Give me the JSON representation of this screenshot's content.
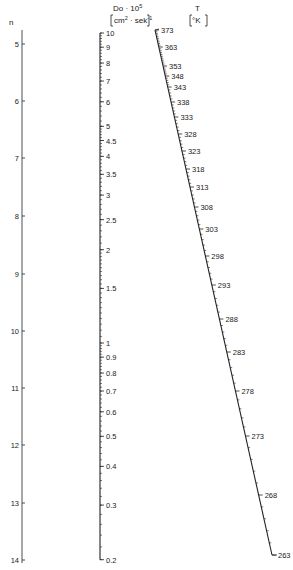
{
  "diagram": {
    "type": "nomogram",
    "colors": {
      "ink": "#222222",
      "background": "#ffffff"
    },
    "axes": {
      "n": {
        "title": "n",
        "scale": "linear",
        "x": 22,
        "ticks": [
          {
            "label": "5",
            "y": 44
          },
          {
            "label": "6",
            "y": 101
          },
          {
            "label": "7",
            "y": 158
          },
          {
            "label": "8",
            "y": 216
          },
          {
            "label": "9",
            "y": 274
          },
          {
            "label": "10",
            "y": 331
          },
          {
            "label": "11",
            "y": 388
          },
          {
            "label": "12",
            "y": 445
          },
          {
            "label": "13",
            "y": 503
          },
          {
            "label": "14",
            "y": 560
          }
        ]
      },
      "D": {
        "title_line1": "Do · 10",
        "title_line1_sup": "5",
        "title_line2": "cm",
        "title_line2_sup1": "2",
        "title_line2_mid": " · sek",
        "title_line2_sup2": "-1",
        "scale": "log",
        "x": 100,
        "y_at_1": 343,
        "px_per_decade": 310,
        "labels": [
          "10",
          "9",
          "8",
          "7",
          "6",
          "5",
          "4.5",
          "4",
          "3.5",
          "3",
          "2.5",
          "2",
          "1.5",
          "1",
          "0.9",
          "0.8",
          "0.7",
          "0.6",
          "0.5",
          "0.4",
          "0.3",
          "0.2"
        ],
        "values": [
          10,
          9,
          8,
          7,
          6,
          5,
          4.5,
          4,
          3.5,
          3,
          2.5,
          2,
          1.5,
          1,
          0.9,
          0.8,
          0.7,
          0.6,
          0.5,
          0.4,
          0.3,
          0.2
        ]
      },
      "T": {
        "title": "T",
        "unit": "°K",
        "scale": "reciprocal",
        "start": {
          "x": 155,
          "y": 30
        },
        "end": {
          "x": 272,
          "y": 555
        },
        "ticks": [
          {
            "label": "373",
            "y": 30
          },
          {
            "label": "363",
            "y": 47
          },
          {
            "label": "353",
            "y": 66
          },
          {
            "label": "348",
            "y": 76
          },
          {
            "label": "343",
            "y": 87
          },
          {
            "label": "338",
            "y": 102
          },
          {
            "label": "333",
            "y": 117
          },
          {
            "label": "328",
            "y": 134
          },
          {
            "label": "323",
            "y": 151
          },
          {
            "label": "318",
            "y": 169
          },
          {
            "label": "313",
            "y": 187
          },
          {
            "label": "308",
            "y": 207
          },
          {
            "label": "303",
            "y": 229
          },
          {
            "label": "298",
            "y": 256
          },
          {
            "label": "293",
            "y": 285
          },
          {
            "label": "288",
            "y": 319
          },
          {
            "label": "283",
            "y": 352
          },
          {
            "label": "278",
            "y": 391
          },
          {
            "label": "273",
            "y": 436
          },
          {
            "label": "268",
            "y": 495
          },
          {
            "label": "263",
            "y": 555
          }
        ]
      }
    }
  }
}
